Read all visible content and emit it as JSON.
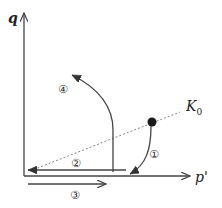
{
  "diagram": {
    "axes": {
      "y_label": "q",
      "x_label": "p'"
    },
    "k0_line": {
      "label": "K",
      "subscript": "0",
      "style": "dotted"
    },
    "initial_state": "filled-dot",
    "paths": [
      {
        "id": "1",
        "marker": "①",
        "description": "curve from K0 state down to p' axis"
      },
      {
        "id": "2",
        "marker": "②",
        "description": "horizontal unloading toward origin"
      },
      {
        "id": "3",
        "marker": "③",
        "description": "horizontal reloading along p'"
      },
      {
        "id": "4",
        "marker": "④",
        "description": "curve rising up-left from p' axis"
      }
    ],
    "colors": {
      "stroke": "#444444",
      "dot": "#1a1a1a",
      "dotted": "#777777"
    }
  }
}
